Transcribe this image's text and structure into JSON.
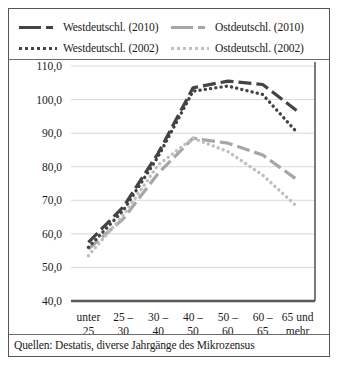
{
  "legend": {
    "items": [
      {
        "label": "Westdeutschl. (2010)",
        "key": "dash-dark",
        "color": "#434343"
      },
      {
        "label": "Ostdeutschl. (2010)",
        "key": "dash-grey",
        "color": "#a6a6a6"
      },
      {
        "label": "Westdeutschl. (2002)",
        "key": "dot-dark",
        "color": "#434343"
      },
      {
        "label": "Ostdeutschl. (2002)",
        "key": "dot-grey",
        "color": "#bfbfbf"
      }
    ]
  },
  "source": {
    "text": "Quellen: Destatis, diverse Jahrgänge des Mikrozensus"
  },
  "axis": {
    "y_ticks": [
      "110,0",
      "100,0",
      "90,0",
      "80,0",
      "70,0",
      "60,0",
      "50,0",
      "40,0"
    ],
    "x_ticks": [
      {
        "line1": "unter",
        "line2": "25"
      },
      {
        "line1": "25 –",
        "line2": "30"
      },
      {
        "line1": "30 –",
        "line2": "40"
      },
      {
        "line1": "40 –",
        "line2": "50"
      },
      {
        "line1": "50 –",
        "line2": "60"
      },
      {
        "line1": "60 –",
        "line2": "65"
      },
      {
        "line1": "65 und",
        "line2": "mehr"
      }
    ]
  },
  "chart_data": {
    "type": "line",
    "title": "",
    "xlabel": "",
    "ylabel": "",
    "ylim": [
      40.0,
      110.0
    ],
    "ytick_step": 10.0,
    "grid": true,
    "legend_position": "top",
    "categories": [
      "unter 25",
      "25 – 30",
      "30 – 40",
      "40 – 50",
      "50 – 60",
      "60 – 65",
      "65 und mehr"
    ],
    "series": [
      {
        "name": "Westdeutschl. (2010)",
        "style": "dashed",
        "color": "#434343",
        "values": [
          57.5,
          68.0,
          84.0,
          103.5,
          105.5,
          104.5,
          96.5
        ]
      },
      {
        "name": "Ostdeutschl. (2010)",
        "style": "dashed",
        "color": "#a6a6a6",
        "values": [
          55.5,
          64.5,
          78.0,
          88.5,
          87.0,
          83.5,
          76.0
        ]
      },
      {
        "name": "Westdeutschl. (2002)",
        "style": "dotted",
        "color": "#434343",
        "values": [
          56.0,
          67.0,
          83.0,
          102.5,
          104.0,
          101.5,
          90.0
        ]
      },
      {
        "name": "Ostdeutschl. (2002)",
        "style": "dotted",
        "color": "#bfbfbf",
        "values": [
          53.5,
          65.5,
          80.5,
          88.5,
          84.5,
          77.5,
          68.0
        ]
      }
    ]
  }
}
